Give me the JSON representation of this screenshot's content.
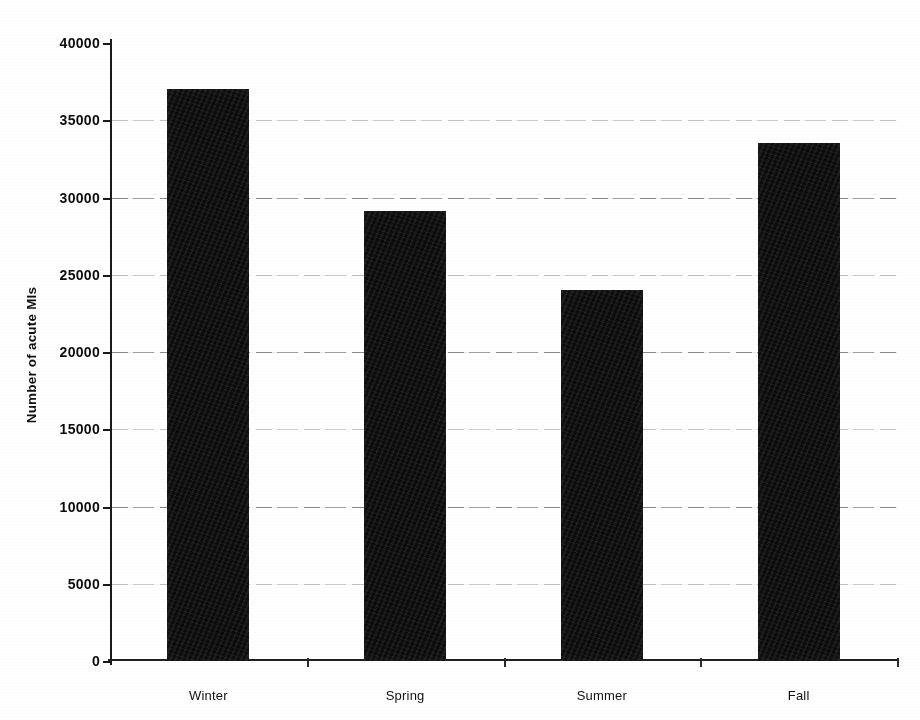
{
  "chart_data": {
    "type": "bar",
    "title": "",
    "subtitle": "",
    "xlabel": "",
    "ylabel": "Number of acute MIs",
    "categories": [
      "Winter",
      "Spring",
      "Summer",
      "Fall"
    ],
    "values": [
      37000,
      29100,
      24000,
      33500
    ],
    "series": [
      {
        "name": "Number of acute MIs",
        "values": [
          37000,
          29100,
          24000,
          33500
        ]
      }
    ],
    "ylim": [
      0,
      40000
    ],
    "ytick_values": [
      0,
      5000,
      10000,
      15000,
      20000,
      25000,
      30000,
      35000,
      40000
    ],
    "ytick_labels": [
      "0",
      "5000",
      "10000",
      "15000",
      "20000",
      "25000",
      "30000",
      "35000",
      "40000"
    ],
    "grid": true,
    "grid_axis": "y",
    "legend": false,
    "legend_position": "none",
    "bar_color": "#0b0b0b",
    "background_color": "#ffffff",
    "axis_color": "#1a1a1a"
  },
  "axes": {
    "y_label": "Number of acute MIs"
  }
}
